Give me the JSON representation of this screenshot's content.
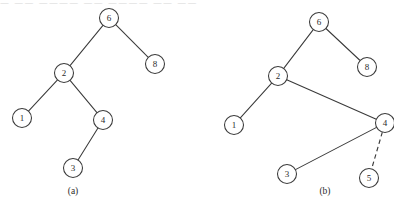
{
  "figure": {
    "top_strip_text": "— —— ———— —— ———— —— ——",
    "stroke_color": "#3a3a3a",
    "node_fill": "#ffffff",
    "background": "#ffffff"
  },
  "panels": [
    {
      "id": "panel-a",
      "caption": "(a)",
      "caption_pos": {
        "x": 73,
        "y": 192
      },
      "nodes": [
        {
          "id": "a6",
          "label": "6",
          "x": 109,
          "y": 18,
          "r": 9.5
        },
        {
          "id": "a2",
          "label": "2",
          "x": 64,
          "y": 73,
          "r": 9.5
        },
        {
          "id": "a8",
          "label": "8",
          "x": 155,
          "y": 64,
          "r": 9.5
        },
        {
          "id": "a1",
          "label": "1",
          "x": 22,
          "y": 118,
          "r": 9.5
        },
        {
          "id": "a4",
          "label": "4",
          "x": 103,
          "y": 120,
          "r": 9.5
        },
        {
          "id": "a3",
          "label": "3",
          "x": 73,
          "y": 168,
          "r": 9.5
        }
      ],
      "edges": [
        {
          "from": "a6",
          "to": "a2",
          "style": "solid"
        },
        {
          "from": "a6",
          "to": "a8",
          "style": "solid"
        },
        {
          "from": "a2",
          "to": "a1",
          "style": "solid"
        },
        {
          "from": "a2",
          "to": "a4",
          "style": "solid"
        },
        {
          "from": "a4",
          "to": "a3",
          "style": "solid"
        }
      ]
    },
    {
      "id": "panel-b",
      "caption": "(b)",
      "caption_pos": {
        "x": 325,
        "y": 192
      },
      "nodes": [
        {
          "id": "b6",
          "label": "6",
          "x": 319,
          "y": 22,
          "r": 9.5
        },
        {
          "id": "b2",
          "label": "2",
          "x": 278,
          "y": 76,
          "r": 9.5
        },
        {
          "id": "b8",
          "label": "8",
          "x": 367,
          "y": 67,
          "r": 9.5
        },
        {
          "id": "b1",
          "label": "1",
          "x": 234,
          "y": 125,
          "r": 9.5
        },
        {
          "id": "b4",
          "label": "4",
          "x": 385,
          "y": 123,
          "r": 9.5
        },
        {
          "id": "b3",
          "label": "3",
          "x": 287,
          "y": 174,
          "r": 9.5
        },
        {
          "id": "b5",
          "label": "5",
          "x": 369,
          "y": 178,
          "r": 9.5
        }
      ],
      "edges": [
        {
          "from": "b6",
          "to": "b2",
          "style": "solid"
        },
        {
          "from": "b6",
          "to": "b8",
          "style": "solid"
        },
        {
          "from": "b2",
          "to": "b1",
          "style": "solid"
        },
        {
          "from": "b2",
          "to": "b4",
          "style": "solid"
        },
        {
          "from": "b4",
          "to": "b3",
          "style": "solid"
        },
        {
          "from": "b4",
          "to": "b5",
          "style": "dashed"
        }
      ]
    }
  ]
}
